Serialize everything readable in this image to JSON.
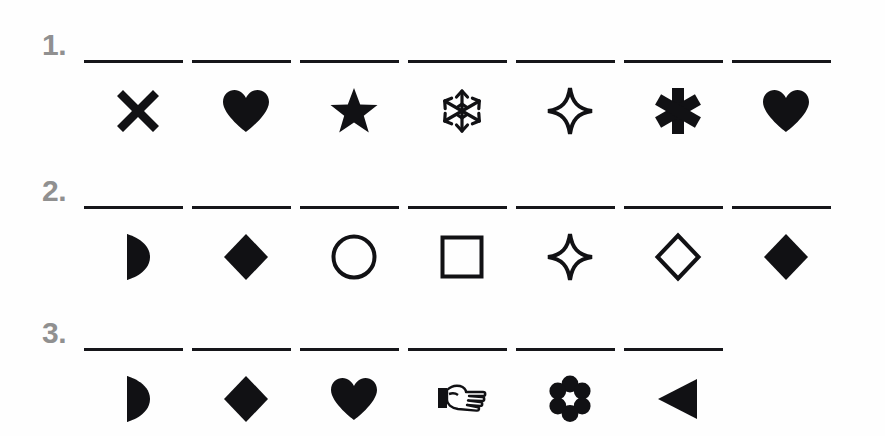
{
  "page": {
    "background_color": "#ffffff",
    "ink_color": "#111114",
    "number_color": "#909090"
  },
  "rows": [
    {
      "number": "1.",
      "blank_count": 7,
      "symbols": [
        {
          "name": "cross-x-icon",
          "label": "X cross",
          "style": "filled"
        },
        {
          "name": "heart-icon",
          "label": "heart",
          "style": "filled"
        },
        {
          "name": "star-five-point-icon",
          "label": "five-pointed star",
          "style": "filled"
        },
        {
          "name": "snowflake-icon",
          "label": "snowflake",
          "style": "filled"
        },
        {
          "name": "sparkle-four-point-icon",
          "label": "four-pointed sparkle",
          "style": "outline"
        },
        {
          "name": "asterisk-icon",
          "label": "asterisk",
          "style": "filled"
        },
        {
          "name": "heart-icon",
          "label": "heart",
          "style": "filled"
        }
      ]
    },
    {
      "number": "2.",
      "blank_count": 7,
      "symbols": [
        {
          "name": "half-moon-icon",
          "label": "half moon",
          "style": "filled"
        },
        {
          "name": "diamond-icon",
          "label": "diamond",
          "style": "filled"
        },
        {
          "name": "circle-icon",
          "label": "circle",
          "style": "outline"
        },
        {
          "name": "square-icon",
          "label": "square",
          "style": "outline"
        },
        {
          "name": "sparkle-four-point-icon",
          "label": "four-pointed sparkle",
          "style": "outline"
        },
        {
          "name": "diamond-icon",
          "label": "diamond",
          "style": "outline"
        },
        {
          "name": "diamond-icon",
          "label": "diamond",
          "style": "filled"
        }
      ]
    },
    {
      "number": "3.",
      "blank_count": 6,
      "symbols": [
        {
          "name": "half-moon-icon",
          "label": "half moon",
          "style": "filled"
        },
        {
          "name": "diamond-icon",
          "label": "diamond",
          "style": "filled"
        },
        {
          "name": "heart-icon",
          "label": "heart",
          "style": "filled"
        },
        {
          "name": "pointing-hand-icon",
          "label": "pointing hand",
          "style": "outline"
        },
        {
          "name": "flower-icon",
          "label": "flower",
          "style": "filled"
        },
        {
          "name": "triangle-left-icon",
          "label": "left triangle",
          "style": "filled"
        }
      ]
    }
  ]
}
